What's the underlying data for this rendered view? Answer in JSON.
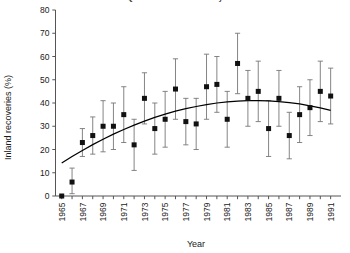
{
  "chart_data": {
    "type": "scatter",
    "title": "Quorn Pintail Tail Secondary",
    "xlabel": "Year",
    "ylabel": "Inland recoveries (%)",
    "xlim": [
      1964.4,
      1992.0
    ],
    "ylim": [
      0,
      80
    ],
    "yticks": [
      0,
      10,
      20,
      30,
      40,
      50,
      60,
      70,
      80
    ],
    "xticks": [
      1965,
      1966,
      1967,
      1968,
      1969,
      1970,
      1971,
      1972,
      1973,
      1974,
      1975,
      1976,
      1977,
      1978,
      1979,
      1980,
      1981,
      1982,
      1983,
      1984,
      1985,
      1986,
      1987,
      1988,
      1989,
      1990,
      1991
    ],
    "xtick_labels": [
      "1965",
      "",
      "1967",
      "",
      "1969",
      "",
      "1971",
      "",
      "1973",
      "",
      "1975",
      "",
      "1977",
      "",
      "1979",
      "",
      "1981",
      "",
      "1983",
      "",
      "1985",
      "",
      "1987",
      "",
      "1989",
      "",
      "1991"
    ],
    "grid": false,
    "legend": null,
    "marker": "filled-square",
    "errorbar_style": "vertical-capped",
    "series": [
      {
        "name": "Inland recoveries",
        "x": [
          1965,
          1966,
          1967,
          1968,
          1969,
          1970,
          1971,
          1972,
          1973,
          1974,
          1975,
          1976,
          1977,
          1978,
          1979,
          1980,
          1981,
          1982,
          1983,
          1984,
          1985,
          1986,
          1987,
          1988,
          1989,
          1990,
          1991
        ],
        "y": [
          0,
          6,
          23,
          26,
          30,
          30,
          35,
          22,
          42,
          29,
          33,
          46,
          32,
          31,
          47,
          48,
          33,
          57,
          42,
          45,
          29,
          42,
          26,
          35,
          38,
          45,
          43
        ],
        "yerr_low": [
          0,
          1,
          17,
          18,
          19,
          20,
          23,
          11,
          31,
          18,
          21,
          33,
          22,
          20,
          33,
          36,
          21,
          44,
          30,
          32,
          17,
          30,
          16,
          23,
          26,
          32,
          31
        ],
        "yerr_high": [
          0,
          12,
          29,
          34,
          41,
          40,
          47,
          33,
          53,
          40,
          45,
          59,
          42,
          42,
          61,
          60,
          45,
          70,
          54,
          58,
          41,
          54,
          36,
          47,
          50,
          58,
          55
        ]
      }
    ],
    "fit_curve": {
      "name": "quadratic fit",
      "x": [
        1965,
        1966,
        1967,
        1968,
        1969,
        1970,
        1971,
        1972,
        1973,
        1974,
        1975,
        1976,
        1977,
        1978,
        1979,
        1980,
        1981,
        1982,
        1983,
        1984,
        1985,
        1986,
        1987,
        1988,
        1989,
        1990,
        1991
      ],
      "y": [
        14.2,
        17.0,
        19.6,
        22.1,
        24.4,
        26.6,
        28.6,
        30.5,
        32.2,
        33.8,
        35.2,
        36.5,
        37.6,
        38.5,
        39.3,
        40.0,
        40.5,
        40.8,
        41.0,
        41.0,
        40.9,
        40.6,
        40.2,
        39.6,
        38.8,
        37.9,
        36.8
      ]
    }
  },
  "colors": {
    "axis": "#555555",
    "marker": "#111111",
    "errorbar": "#777777",
    "curve": "#000000",
    "text": "#1a1a1a"
  }
}
